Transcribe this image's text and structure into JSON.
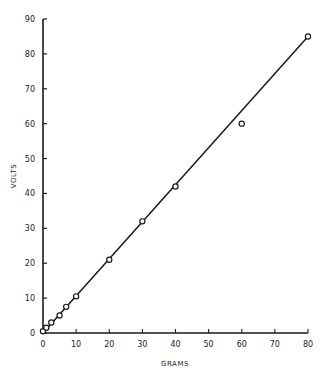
{
  "chart_data": {
    "type": "scatter",
    "title": "",
    "xlabel": "GRAMS",
    "ylabel": "VOLTS",
    "xlim": [
      0,
      80
    ],
    "ylim": [
      0,
      90
    ],
    "x_ticks": [
      0,
      10,
      20,
      30,
      40,
      50,
      60,
      70,
      80
    ],
    "y_ticks": [
      0,
      10,
      20,
      30,
      40,
      50,
      60,
      70,
      80,
      90
    ],
    "grid": false,
    "legend": null,
    "series": [
      {
        "name": "measured",
        "marker": "open-circle",
        "x": [
          0,
          1,
          2.5,
          5,
          7,
          10,
          20,
          30,
          40,
          60,
          80
        ],
        "y": [
          0.5,
          1.5,
          3,
          5,
          7.5,
          10.5,
          21,
          32,
          42,
          60,
          85
        ]
      },
      {
        "name": "linear fit",
        "style": "line",
        "x": [
          0,
          80
        ],
        "y": [
          0,
          85
        ]
      }
    ]
  },
  "colors": {
    "ink": "#1a1a1a",
    "background": "#ffffff"
  }
}
